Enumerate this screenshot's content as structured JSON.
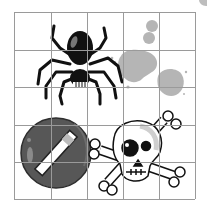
{
  "grid": {
    "rows": 5,
    "cols": 5,
    "x_lines": [
      14,
      51,
      87,
      123,
      159,
      195
    ],
    "y_lines": [
      12,
      50,
      87,
      125,
      162,
      199
    ],
    "line_color": "#9a9a9a"
  },
  "objects": [
    {
      "id": "spider",
      "label": "spider"
    },
    {
      "id": "ink-splats",
      "label": "ink splats"
    },
    {
      "id": "no-sign",
      "label": "no sign"
    },
    {
      "id": "skull-crossbones",
      "label": "skull and crossbones"
    }
  ],
  "colors": {
    "background": "#ffffff",
    "black": "#111111",
    "splat": "#b5b5b5",
    "no_sign_fill": "#555555",
    "no_sign_ring": "#3a3a3a",
    "skull_shade": "#cfcfcf"
  }
}
